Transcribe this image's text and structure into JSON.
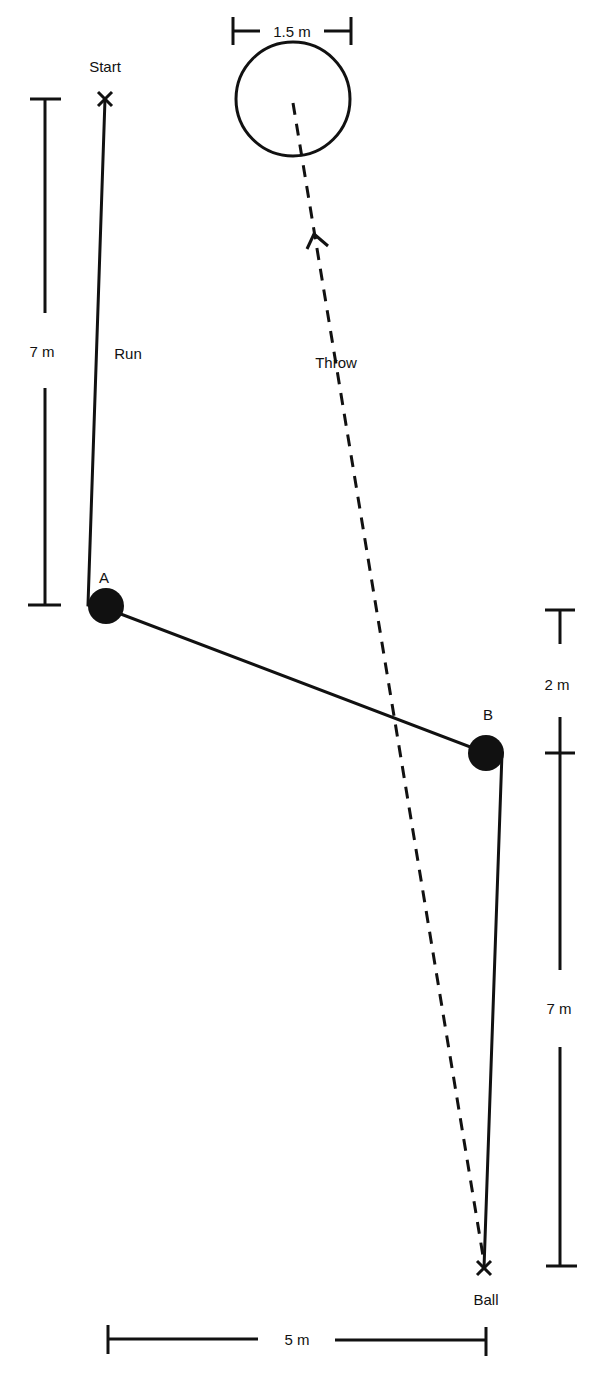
{
  "labels": {
    "start": "Start",
    "ball": "Ball",
    "run": "Run",
    "throw": "Throw",
    "point_a": "A",
    "point_b": "B"
  },
  "dimensions": {
    "circle_diameter": "1.5 m",
    "start_to_a": "7 m",
    "a_to_b_vertical": "2 m",
    "b_to_ball": "7 m",
    "horizontal_width": "5 m"
  },
  "colors": {
    "ink": "#111111",
    "background": "#ffffff"
  }
}
